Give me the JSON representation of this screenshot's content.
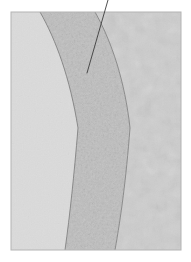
{
  "figure": {
    "type": "grayscale-micrograph",
    "panel": {
      "x": 11,
      "y": 12,
      "width": 170,
      "height": 238,
      "border_color": "#b4b4b4",
      "background_color": "#dcdcdc"
    },
    "regions": [
      {
        "name": "left-matrix-region",
        "label": "",
        "texture": "smooth-fine-grain",
        "fill_color": "#dedede",
        "description": "smooth uniform light gray matrix on the left of the inner arc"
      },
      {
        "name": "middle-granular-band",
        "label": "",
        "texture": "coarse-speckled-granular",
        "fill_color": "#d2d2d2",
        "description": "curved band of coarse granular speckled material between the two arcs"
      },
      {
        "name": "right-mottled-region",
        "label": "",
        "texture": "cloudy-mottled",
        "fill_color": "#dcdcdc",
        "description": "cloudy mottled region to the right of the outer arc"
      }
    ],
    "boundaries": [
      {
        "name": "inner-arc-boundary",
        "stroke_color": "#7a7a7a",
        "stroke_width": 0.8,
        "points": "40,12 56,40 70,78 78,128 74,176 65,250"
      },
      {
        "name": "outer-arc-boundary",
        "stroke_color": "#7a7a7a",
        "stroke_width": 0.8,
        "points": "95,12 112,42 125,82 130,128 126,180 115,250"
      }
    ],
    "annotation": {
      "name": "leader-line",
      "stroke_color": "#3c3c3c",
      "stroke_width": 0.9,
      "start_x": 108,
      "start_y": 0,
      "end_x": 87,
      "end_y": 73,
      "label": ""
    },
    "caption": ""
  }
}
